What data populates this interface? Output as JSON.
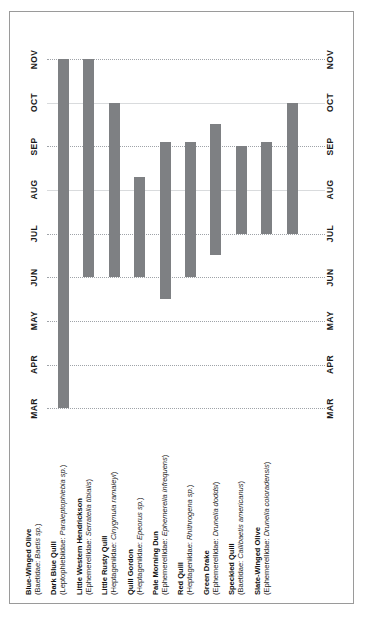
{
  "axis": {
    "ticks": [
      "MAR",
      "APR",
      "MAY",
      "JUN",
      "JUL",
      "AUG",
      "SEP",
      "OCT",
      "NOV"
    ],
    "left_label_name": "month-axis-left",
    "right_label_name": "month-axis-right"
  },
  "colors": {
    "bar": "#7e8083",
    "gridline": "#9fa3a8",
    "frame": "#9a9a9a",
    "text": "#111111"
  },
  "species": [
    {
      "common": "Blue-Winged Olive",
      "family": "Baetidae",
      "latin": "Baetis sp.",
      "scientific": "(Baetidae: Baetis sp.)",
      "start": "MAR",
      "end": "NOV"
    },
    {
      "common": "Dark Blue Quill",
      "family": "Leptophlebiidae",
      "latin": "Paraleptophlebia sp.",
      "scientific": "(Leptophlebiidae: Paraleptophlebia sp.)",
      "start": "JUN",
      "end": "NOV"
    },
    {
      "common": "Little Western Hendrickson",
      "family": "Ephemerellidae",
      "latin": "Serratella tibialis",
      "scientific": "(Ephemerellidae: Serratella tibialis)",
      "start": "JUN",
      "end": "OCT"
    },
    {
      "common": "Little Rusty Quill",
      "family": "Heptageniidae",
      "latin": "Cinygmula ramaleyi",
      "scientific": "(Heptageniidae: Cinygmula ramaleyi)",
      "start": "JUN",
      "end": "AUG"
    },
    {
      "common": "Quill Gordon",
      "family": "Heptageniidae",
      "latin": "Epeorus sp.",
      "scientific": "(Heptageniidae: Epeorus sp.)",
      "start": "MAY",
      "end": "SEP"
    },
    {
      "common": "Pale Morning Dun",
      "family": "Ephemerellidae",
      "latin": "Ephemerella infrequens",
      "scientific": "(Ephemerellidae: Ephemerella infrequens)",
      "start": "JUN",
      "end": "SEP"
    },
    {
      "common": "Red Quill",
      "family": "Heptageniidae",
      "latin": "Rhithrogena sp.",
      "scientific": "(Heptageniidae: Rhithrogena sp.)",
      "start": "JUN",
      "end": "SEP"
    },
    {
      "common": "Green Drake",
      "family": "Ephemerellidae",
      "latin": "Drunella doddsi",
      "scientific": "(Ephemerellidae: Drunella doddsi)",
      "start": "JUL",
      "end": "SEP"
    },
    {
      "common": "Speckled Quill",
      "family": "Baetidae",
      "latin": "Callibaetis americanus",
      "scientific": "(Baetidae: Callibaetis americanus)",
      "start": "JUL",
      "end": "SEP"
    },
    {
      "common": "Slate-Winged Olive",
      "family": "Ephemerellidae",
      "latin": "Drunella coloradensis",
      "scientific": "(Ephemerellidae: Drunella coloradensis)",
      "start": "JUL",
      "end": "OCT"
    }
  ],
  "chart_data": {
    "type": "bar",
    "orientation": "horizontal-rotated",
    "title": "",
    "xlabel": "",
    "ylabel": "",
    "grid": true,
    "legend_position": "below",
    "axis_ticks": [
      "MAR",
      "APR",
      "MAY",
      "JUN",
      "JUL",
      "AUG",
      "SEP",
      "OCT",
      "NOV"
    ],
    "axis_range": [
      "MAR",
      "NOV"
    ],
    "categories": [
      "Blue-Winged Olive",
      "Dark Blue Quill",
      "Little Western Hendrickson",
      "Little Rusty Quill",
      "Quill Gordon",
      "Pale Morning Dun",
      "Red Quill",
      "Green Drake",
      "Speckled Quill",
      "Slate-Winged Olive"
    ],
    "note": "Each bar is a hatch-period range spanning from start month to end month. Values given as decimal month index where MAR=3.0, APR=4.0 ... NOV=11.0.",
    "ranges": [
      {
        "category": "Blue-Winged Olive",
        "start": 3.0,
        "end": 11.0,
        "start_label": "MAR",
        "end_label": "NOV"
      },
      {
        "category": "Dark Blue Quill",
        "start": 6.0,
        "end": 11.0,
        "start_label": "JUN",
        "end_label": "NOV"
      },
      {
        "category": "Little Western Hendrickson",
        "start": 6.0,
        "end": 10.0,
        "start_label": "JUN",
        "end_label": "OCT"
      },
      {
        "category": "Little Rusty Quill",
        "start": 6.0,
        "end": 8.3,
        "start_label": "JUN",
        "end_label": "early AUG"
      },
      {
        "category": "Quill Gordon",
        "start": 5.5,
        "end": 9.1,
        "start_label": "mid MAY",
        "end_label": "SEP"
      },
      {
        "category": "Pale Morning Dun",
        "start": 6.0,
        "end": 9.1,
        "start_label": "JUN",
        "end_label": "SEP"
      },
      {
        "category": "Red Quill",
        "start": 6.5,
        "end": 9.5,
        "start_label": "mid JUN",
        "end_label": "late SEP"
      },
      {
        "category": "Green Drake",
        "start": 7.0,
        "end": 9.0,
        "start_label": "JUL",
        "end_label": "SEP"
      },
      {
        "category": "Speckled Quill",
        "start": 7.0,
        "end": 9.1,
        "start_label": "JUL",
        "end_label": "SEP"
      },
      {
        "category": "Slate-Winged Olive",
        "start": 7.0,
        "end": 10.0,
        "start_label": "JUL",
        "end_label": "OCT"
      }
    ]
  }
}
